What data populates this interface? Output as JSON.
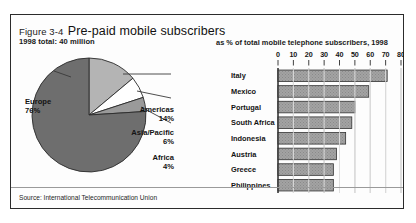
{
  "figure": {
    "number": "Figure 3-4",
    "title": "Pre-paid mobile subscribers",
    "subtitle": "1998 total: 40 million",
    "source": "Source: International Telecommunication Union"
  },
  "colors": {
    "frame": "#2b2b2b",
    "pie_europe": "#6e6e6e",
    "pie_americas": "#b4b4b4",
    "pie_asia_pacific": "#ffffff",
    "pie_africa": "#9a9a9a",
    "bar_fill": "#9e9e9e",
    "axis": "#2b2b2b",
    "gridline": "#8c8c8c"
  },
  "chart_data": [
    {
      "type": "pie",
      "title": "Pre-paid mobile subscribers",
      "subtitle": "1998 total: 40 million",
      "unit": "%",
      "legend_position": "callout-labels",
      "categories": [
        "Europe",
        "Americas",
        "Asia/Pacific",
        "Africa"
      ],
      "values": [
        76,
        14,
        6,
        4
      ],
      "labels": [
        "76%",
        "14%",
        "6%",
        "4%"
      ],
      "slice_colors": [
        "#6e6e6e",
        "#b4b4b4",
        "#ffffff",
        "#9a9a9a"
      ]
    },
    {
      "type": "bar",
      "orientation": "horizontal",
      "title": "as % of total mobile telephone subscribers, 1998",
      "xlabel": "",
      "ylabel": "",
      "xlim": [
        0,
        80
      ],
      "xticks": [
        0,
        10,
        20,
        30,
        40,
        50,
        60,
        70,
        80
      ],
      "xtick_labels": [
        "0",
        "10",
        "20",
        "30",
        "40",
        "50",
        "60",
        "70",
        "80"
      ],
      "grid": true,
      "categories": [
        "Italy",
        "Mexico",
        "Portugal",
        "South Africa",
        "Indonesia",
        "Austria",
        "Greece",
        "Philippines"
      ],
      "values": [
        71,
        59,
        50,
        48,
        44,
        38,
        36,
        36
      ]
    }
  ]
}
